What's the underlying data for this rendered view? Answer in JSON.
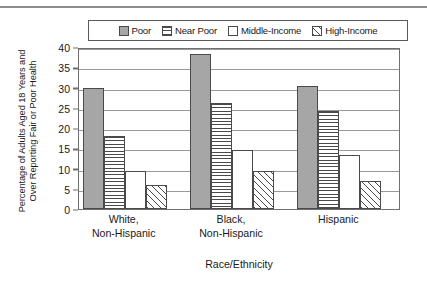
{
  "chart_data": {
    "type": "bar",
    "title": "",
    "subtitle": "",
    "xlabel": "Race/Ethnicity",
    "ylabel_lines": [
      "Percentage of Adults Aged 18 Years and",
      "Over Reporting Fair or Poor Health"
    ],
    "ylabel": "Percentage of Adults Aged 18 Years and Over Reporting Fair or Poor Health",
    "categories": [
      "White, Non-Hispanic",
      "Black, Non-Hispanic",
      "Hispanic"
    ],
    "category_lines": [
      [
        "White,",
        "Non-Hispanic"
      ],
      [
        "Black,",
        "Non-Hispanic"
      ],
      [
        "Hispanic",
        ""
      ]
    ],
    "series": [
      {
        "name": "Poor",
        "pattern": "solid-gray",
        "values": [
          30.0,
          38.2,
          30.4
        ]
      },
      {
        "name": "Near Poor",
        "pattern": "horizontal-lines",
        "values": [
          18.0,
          26.1,
          24.1
        ]
      },
      {
        "name": "Middle-Income",
        "pattern": "white-empty",
        "values": [
          9.5,
          14.6,
          13.4
        ]
      },
      {
        "name": "High-Income",
        "pattern": "diagonal-hatch",
        "values": [
          6.0,
          9.4,
          7.0
        ]
      }
    ],
    "ylim": [
      0,
      40
    ],
    "ytick_values": [
      0,
      5,
      10,
      15,
      20,
      25,
      30,
      35,
      40
    ],
    "ytick_labels": [
      "0",
      "5",
      "10",
      "15",
      "20",
      "25",
      "30",
      "35",
      "40"
    ],
    "grid": true,
    "grid_axis": "y",
    "legend_position": "top-center",
    "legend_entries": [
      "Poor",
      "Near Poor",
      "Middle-Income",
      "High-Income"
    ]
  },
  "colors": {
    "bar_fill_gray": "#a6a6a6",
    "bar_outline": "#4a4a4a",
    "gridline": "#9a9a9a",
    "axis_border": "#6f6f6f",
    "legend_border": "#5a5a5a",
    "top_rule": "#8d8d8d",
    "background": "#ffffff",
    "text": "#1a1a1a"
  }
}
